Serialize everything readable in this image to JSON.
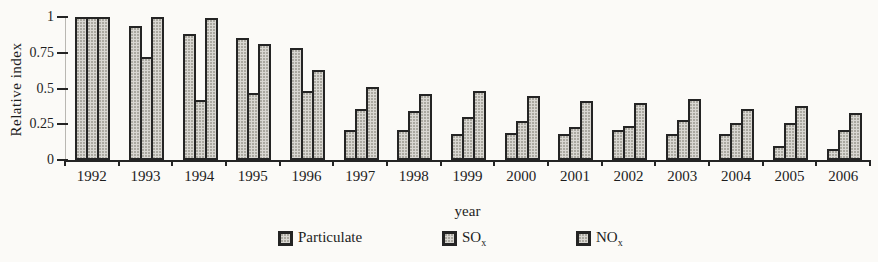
{
  "chart_data": {
    "type": "bar",
    "xlabel": "year",
    "ylabel": "Relative index",
    "ylim": [
      0,
      1
    ],
    "yticks": [
      0,
      0.25,
      0.5,
      0.75,
      1
    ],
    "ytick_labels": [
      "0",
      "0.25",
      "0.5",
      "0.75",
      "1"
    ],
    "grid": false,
    "legend_position": "bottom",
    "categories": [
      "1992",
      "1993",
      "1994",
      "1995",
      "1996",
      "1997",
      "1998",
      "1999",
      "2000",
      "2001",
      "2002",
      "2003",
      "2004",
      "2005",
      "2006"
    ],
    "series": [
      {
        "name": "Particulate",
        "key": "particulate",
        "values": [
          1.0,
          0.94,
          0.88,
          0.85,
          0.78,
          0.21,
          0.21,
          0.18,
          0.19,
          0.18,
          0.21,
          0.18,
          0.18,
          0.1,
          0.08
        ]
      },
      {
        "name": "SOx",
        "key": "sox",
        "values": [
          1.0,
          0.72,
          0.42,
          0.47,
          0.48,
          0.36,
          0.34,
          0.3,
          0.27,
          0.23,
          0.24,
          0.28,
          0.26,
          0.26,
          0.21
        ]
      },
      {
        "name": "NOx",
        "key": "nox",
        "values": [
          1.0,
          1.0,
          0.99,
          0.81,
          0.63,
          0.51,
          0.46,
          0.48,
          0.45,
          0.41,
          0.4,
          0.43,
          0.36,
          0.38,
          0.33
        ]
      }
    ]
  },
  "legend": {
    "items": [
      {
        "base": "Particulate",
        "sub": ""
      },
      {
        "base": "SO",
        "sub": "x"
      },
      {
        "base": "NO",
        "sub": "x"
      }
    ]
  },
  "colors": {
    "background": "#fbfaf7",
    "bar_fill": "#d9d7d2",
    "bar_speckle": "#a9a79f",
    "bar_border": "#242424",
    "axis": "#242424",
    "text": "#1d1d1d"
  }
}
